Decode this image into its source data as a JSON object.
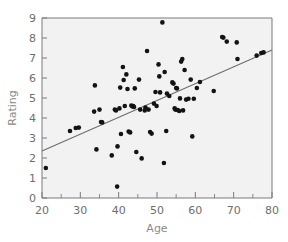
{
  "chart_data": {
    "type": "scatter",
    "title": "",
    "xlabel": "Age",
    "ylabel": "Rating",
    "xlim": [
      20,
      80
    ],
    "ylim": [
      0,
      9
    ],
    "xticks": [
      20,
      30,
      40,
      50,
      60,
      70,
      80
    ],
    "yticks": [
      0,
      1,
      2,
      3,
      4,
      5,
      6,
      7,
      8,
      9
    ],
    "xtick_labels": [
      "20",
      "30",
      "40",
      "50",
      "60",
      "70",
      "80"
    ],
    "ytick_labels": [
      "0",
      "1",
      "2",
      "3",
      "4",
      "5",
      "6",
      "7",
      "8",
      "9"
    ],
    "x_minor_step": 5,
    "grid": false,
    "legend": null,
    "marker": "filled-circle",
    "marker_color": "#131313",
    "points": [
      [
        21.0,
        1.5
      ],
      [
        27.3,
        3.35
      ],
      [
        28.8,
        3.5
      ],
      [
        29.6,
        3.52
      ],
      [
        33.8,
        5.63
      ],
      [
        33.6,
        4.32
      ],
      [
        34.2,
        2.43
      ],
      [
        35.0,
        4.42
      ],
      [
        35.4,
        3.8
      ],
      [
        35.7,
        3.78
      ],
      [
        38.2,
        2.13
      ],
      [
        39.0,
        4.42
      ],
      [
        39.3,
        4.38
      ],
      [
        39.6,
        0.57
      ],
      [
        39.7,
        2.58
      ],
      [
        40.2,
        4.48
      ],
      [
        40.4,
        5.52
      ],
      [
        40.6,
        3.2
      ],
      [
        41.1,
        6.55
      ],
      [
        41.3,
        5.9
      ],
      [
        41.6,
        4.6
      ],
      [
        42.0,
        6.18
      ],
      [
        42.3,
        5.45
      ],
      [
        42.6,
        3.32
      ],
      [
        43.0,
        3.28
      ],
      [
        43.3,
        4.62
      ],
      [
        43.6,
        4.58
      ],
      [
        43.8,
        4.6
      ],
      [
        44.0,
        4.55
      ],
      [
        44.2,
        5.48
      ],
      [
        44.6,
        2.3
      ],
      [
        45.3,
        5.92
      ],
      [
        45.6,
        4.42
      ],
      [
        46.0,
        1.98
      ],
      [
        46.8,
        4.38
      ],
      [
        47.0,
        4.52
      ],
      [
        47.4,
        7.35
      ],
      [
        47.8,
        4.42
      ],
      [
        48.2,
        3.3
      ],
      [
        48.6,
        3.22
      ],
      [
        49.2,
        4.72
      ],
      [
        49.6,
        5.3
      ],
      [
        49.9,
        4.6
      ],
      [
        50.4,
        6.68
      ],
      [
        50.6,
        6.08
      ],
      [
        50.8,
        5.28
      ],
      [
        51.4,
        8.78
      ],
      [
        51.8,
        1.75
      ],
      [
        52.0,
        6.3
      ],
      [
        52.4,
        3.35
      ],
      [
        52.6,
        5.22
      ],
      [
        53.2,
        5.1
      ],
      [
        54.0,
        5.78
      ],
      [
        54.3,
        5.72
      ],
      [
        54.6,
        4.48
      ],
      [
        54.8,
        4.42
      ],
      [
        55.0,
        5.5
      ],
      [
        55.2,
        5.48
      ],
      [
        55.4,
        4.4
      ],
      [
        55.8,
        4.35
      ],
      [
        56.0,
        4.98
      ],
      [
        56.3,
        6.82
      ],
      [
        56.6,
        6.95
      ],
      [
        56.8,
        4.38
      ],
      [
        57.2,
        6.4
      ],
      [
        57.6,
        4.92
      ],
      [
        58.2,
        4.96
      ],
      [
        58.8,
        5.92
      ],
      [
        59.2,
        3.08
      ],
      [
        59.6,
        4.96
      ],
      [
        60.4,
        5.5
      ],
      [
        61.2,
        5.8
      ],
      [
        64.8,
        5.35
      ],
      [
        67.0,
        8.05
      ],
      [
        67.3,
        8.02
      ],
      [
        68.2,
        7.82
      ],
      [
        70.8,
        7.78
      ],
      [
        71.0,
        6.95
      ],
      [
        76.0,
        7.12
      ],
      [
        77.2,
        7.25
      ],
      [
        77.8,
        7.28
      ]
    ],
    "trendline": {
      "type": "linear",
      "x_start": 20,
      "y_start": 2.35,
      "x_end": 80,
      "y_end": 7.4,
      "color": "#6d6d6d"
    }
  }
}
